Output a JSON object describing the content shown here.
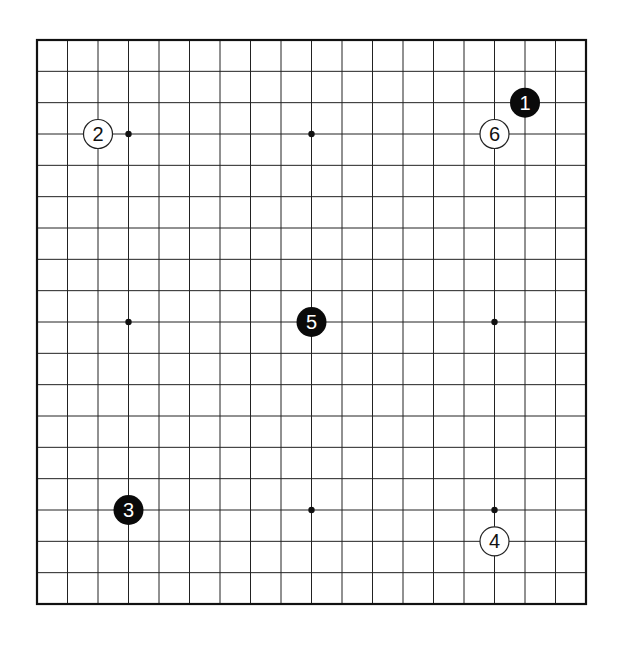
{
  "game": "Go",
  "board": {
    "size": 19,
    "left": 37,
    "top": 40,
    "right": 586,
    "bottom": 604,
    "line_color": "#222222",
    "border_color": "#111111",
    "background": "#ffffff",
    "star_points": [
      [
        3,
        3
      ],
      [
        9,
        3
      ],
      [
        15,
        3
      ],
      [
        3,
        9
      ],
      [
        9,
        9
      ],
      [
        15,
        9
      ],
      [
        3,
        15
      ],
      [
        9,
        15
      ],
      [
        15,
        15
      ]
    ]
  },
  "stones": [
    {
      "move": "1",
      "color": "black",
      "col": 16,
      "row": 2
    },
    {
      "move": "2",
      "color": "white",
      "col": 2,
      "row": 3
    },
    {
      "move": "3",
      "color": "black",
      "col": 3,
      "row": 15
    },
    {
      "move": "4",
      "color": "white",
      "col": 15,
      "row": 16
    },
    {
      "move": "5",
      "color": "black",
      "col": 9,
      "row": 9
    },
    {
      "move": "6",
      "color": "white",
      "col": 15,
      "row": 3
    }
  ],
  "colors": {
    "black_stone": "#0a0a0a",
    "black_stone_text": "#ffffff",
    "white_stone": "#ffffff",
    "white_stone_text": "#111111",
    "white_stone_border": "#222222"
  }
}
